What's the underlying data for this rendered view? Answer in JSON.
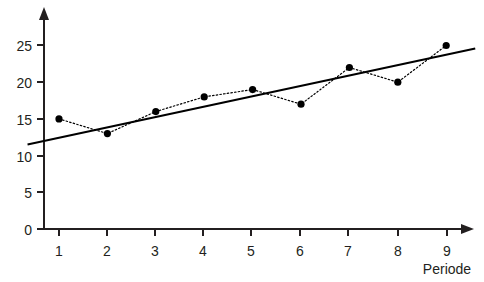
{
  "chart_data": {
    "type": "line",
    "title": "",
    "subtitle": "",
    "xlabel": "Periode",
    "ylabel": "",
    "x": [
      1,
      2,
      3,
      4,
      5,
      6,
      7,
      8,
      9
    ],
    "xtick_labels": [
      "1",
      "2",
      "3",
      "4",
      "5",
      "6",
      "7",
      "8",
      "9"
    ],
    "ytick_labels": [
      "0",
      "5",
      "10",
      "15",
      "20",
      "25"
    ],
    "yticks": [
      0,
      5,
      10,
      15,
      20,
      25
    ],
    "xlim": [
      0.35,
      9.6
    ],
    "ylim": [
      0,
      27.5
    ],
    "grid": false,
    "legend": null,
    "series": [
      {
        "name": "data",
        "style": "dotted-line-with-markers",
        "marker": "filled-circle",
        "color": "#000000",
        "values": [
          15,
          13,
          16,
          18,
          19,
          17,
          22,
          20,
          25
        ]
      },
      {
        "name": "trend",
        "style": "solid-straight-line",
        "color": "#000000",
        "x_endpoints": [
          0.35,
          9.6
        ],
        "y_endpoints": [
          11.5,
          24.6
        ]
      }
    ],
    "annotations": []
  },
  "axes": {
    "x_axis_arrow": "arrow-right",
    "y_axis_arrow": "arrow-up",
    "axis_color": "#231f20"
  }
}
